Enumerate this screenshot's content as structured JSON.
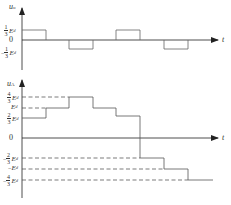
{
  "top_plot": {
    "y_label": "u",
    "y_label_sub": "o",
    "x_label": "t",
    "zero_label": "0",
    "ticks": [
      {
        "sign": "",
        "num": "1",
        "den": "3",
        "var": "E",
        "sub": "d"
      },
      {
        "sign": "−",
        "num": "1",
        "den": "3",
        "var": "E",
        "sub": "d"
      }
    ],
    "pulses": [
      {
        "level": "+1/3 Ed",
        "x_start": 22,
        "x_end": 46
      },
      {
        "level": "-1/3 Ed",
        "x_start": 69,
        "x_end": 93
      },
      {
        "level": "+1/3 Ed",
        "x_start": 116,
        "x_end": 140
      },
      {
        "level": "-1/3 Ed",
        "x_start": 164,
        "x_end": 188
      }
    ]
  },
  "bottom_plot": {
    "y_label": "u",
    "y_label_sub": "A",
    "x_label": "t",
    "zero_label": "0",
    "ticks": [
      {
        "sign": "",
        "num": "4",
        "den": "3",
        "var": "E",
        "sub": "d"
      },
      {
        "sign": "",
        "num": "",
        "den": "",
        "var": "E",
        "sub": "d"
      },
      {
        "sign": "",
        "num": "2",
        "den": "3",
        "var": "E",
        "sub": "d"
      },
      {
        "sign": "−",
        "num": "2",
        "den": "3",
        "var": "E",
        "sub": "d"
      },
      {
        "sign": "−",
        "num": "",
        "den": "",
        "var": "E",
        "sub": "d"
      },
      {
        "sign": "−",
        "num": "4",
        "den": "3",
        "var": "E",
        "sub": "d"
      }
    ],
    "steps": [
      {
        "level": "2/3 Ed",
        "x_start": 22,
        "x_end": 46
      },
      {
        "level": "Ed",
        "x_start": 46,
        "x_end": 69
      },
      {
        "level": "4/3 Ed",
        "x_start": 69,
        "x_end": 93
      },
      {
        "level": "Ed",
        "x_start": 93,
        "x_end": 116
      },
      {
        "level": "2/3 Ed",
        "x_start": 116,
        "x_end": 140
      },
      {
        "level": "-2/3 Ed",
        "x_start": 140,
        "x_end": 164
      },
      {
        "level": "-Ed",
        "x_start": 164,
        "x_end": 188
      },
      {
        "level": "-4/3 Ed",
        "x_start": 188,
        "x_end": 213
      }
    ]
  },
  "colors": {
    "axis": "#222222",
    "waveform": "#555555",
    "dashed": "#444444"
  }
}
